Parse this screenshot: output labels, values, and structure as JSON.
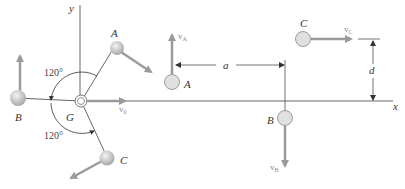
{
  "diagram": {
    "type": "physics-rigid-body-particles",
    "left_figure": {
      "axis_y_label": "y",
      "center_label": "G",
      "center_velocity_label": "v_0",
      "particles": [
        {
          "label": "A"
        },
        {
          "label": "B"
        },
        {
          "label": "C"
        }
      ],
      "angle_top": "120°",
      "angle_bottom": "120°"
    },
    "right_figure": {
      "axis_x_label": "x",
      "particles": [
        {
          "label": "A",
          "velocity_label": "v_A",
          "velocity_direction": "up"
        },
        {
          "label": "B",
          "velocity_label": "v_B",
          "velocity_direction": "down"
        },
        {
          "label": "C",
          "velocity_label": "v_C",
          "velocity_direction": "right"
        }
      ],
      "dimension_a": "a",
      "dimension_d": "d"
    },
    "colors": {
      "line": "#555555",
      "arrow": "#9a9a9a",
      "sphere_fill": "#d8d8d8",
      "sphere_stroke": "#888888"
    }
  }
}
